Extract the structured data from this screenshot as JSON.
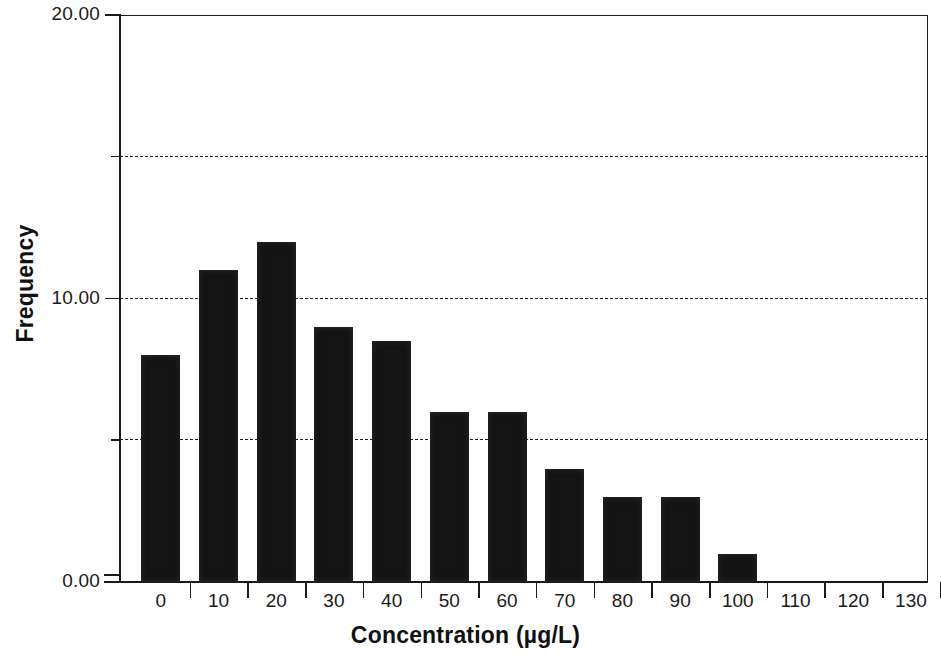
{
  "chart_data": {
    "type": "bar",
    "title": "",
    "subtitle": "",
    "xlabel": "Concentration (µg/L)",
    "ylabel": "Frequency",
    "categories": [
      "0",
      "10",
      "20",
      "30",
      "40",
      "50",
      "60",
      "70",
      "80",
      "90",
      "100",
      "110",
      "120",
      "130"
    ],
    "values": [
      8,
      11,
      12,
      9,
      8.5,
      6,
      6,
      4,
      3,
      3,
      1,
      0,
      0,
      0
    ],
    "x_tick_labels": [
      "0",
      "10",
      "20",
      "30",
      "40",
      "50",
      "60",
      "70",
      "80",
      "90",
      "100",
      "110",
      "120",
      "130"
    ],
    "y_tick_labels": [
      "20.00",
      "10.00",
      "0.00"
    ],
    "y_tick_values": [
      20,
      10,
      0
    ],
    "y_minor_tick_values": [
      15,
      5
    ],
    "ylim": [
      0,
      20
    ],
    "grid": "horizontal-dashed",
    "gridline_values": [
      15,
      10,
      5
    ],
    "legend": "none",
    "bar_color": "#141414",
    "axis_color": "#1a1a1a",
    "background_color": "#ffffff"
  },
  "axis": {
    "x_title": "Concentration (µg/L)",
    "y_title": "Frequency"
  }
}
